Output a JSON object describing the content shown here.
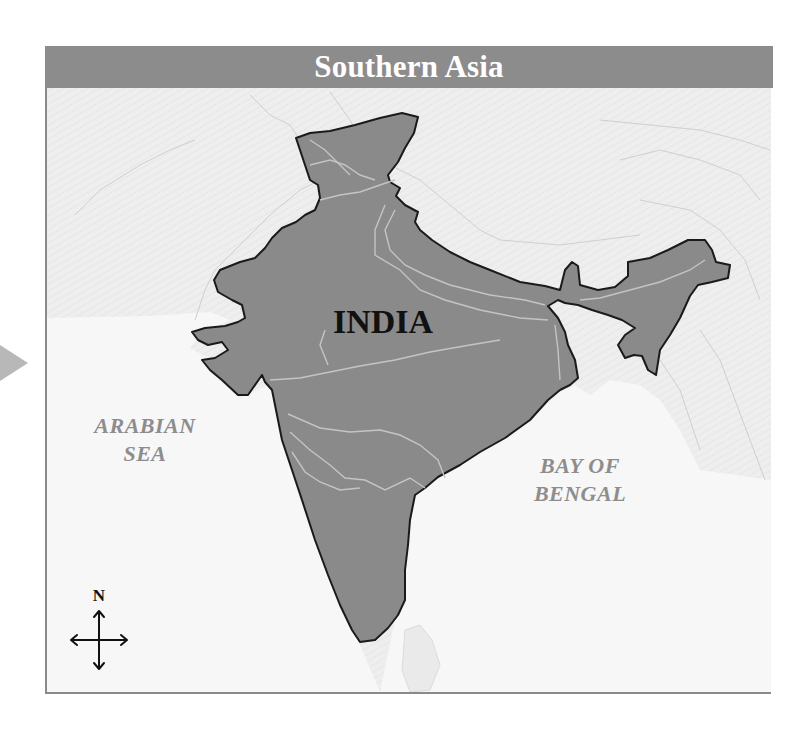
{
  "title": "Southern Asia",
  "labels": {
    "country": "INDIA",
    "sea_west_line1": "ARABIAN",
    "sea_west_line2": "SEA",
    "sea_east_line1": "BAY OF",
    "sea_east_line2": "BENGAL"
  },
  "compass": {
    "north_label": "N"
  },
  "icons": {
    "pointer": "play-triangle-icon",
    "compass": "compass-rose-icon"
  },
  "colors": {
    "title_bar": "#8c8c8c",
    "title_text": "#ffffff",
    "land_highlight": "#8a8a8a",
    "land_border": "#1a1a1a",
    "background_land": "#ededed",
    "water": "#f7f7f7",
    "rivers": "#c8c8c8",
    "sea_label": "#8d8d8d",
    "frame_border": "#8a8a8a"
  }
}
